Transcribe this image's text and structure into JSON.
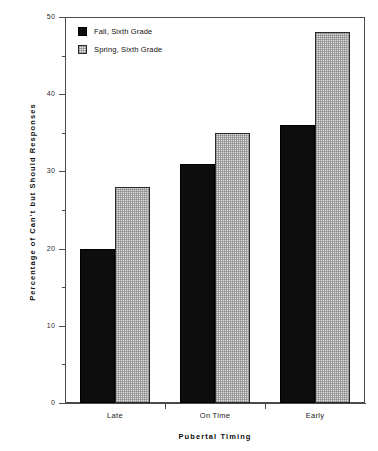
{
  "chart_data": {
    "type": "bar",
    "title": "",
    "xlabel": "Pubertal  Timing",
    "ylabel": "Percentage  of  Can't  but  Should  Responses",
    "categories": [
      "Late",
      "On Time",
      "Early"
    ],
    "series": [
      {
        "name": "Fall, Sixth Grade",
        "values": [
          20,
          31,
          36
        ],
        "color": "#0d0d0d"
      },
      {
        "name": "Spring, Sixth Grade",
        "values": [
          28,
          35,
          48
        ],
        "color": "#dedede"
      }
    ],
    "ylim": [
      0,
      50
    ],
    "ytick_labels": [
      "0",
      "10",
      "20",
      "30",
      "40",
      "50"
    ],
    "ytick_values": [
      0,
      10,
      20,
      30,
      40,
      50
    ],
    "yminor_values": [
      5,
      15,
      25,
      35,
      45
    ],
    "grid": false,
    "legend_position": "top-left-inside"
  },
  "legend": {
    "entries": [
      {
        "label": "Fall, Sixth Grade"
      },
      {
        "label": "Spring, Sixth Grade"
      }
    ]
  }
}
